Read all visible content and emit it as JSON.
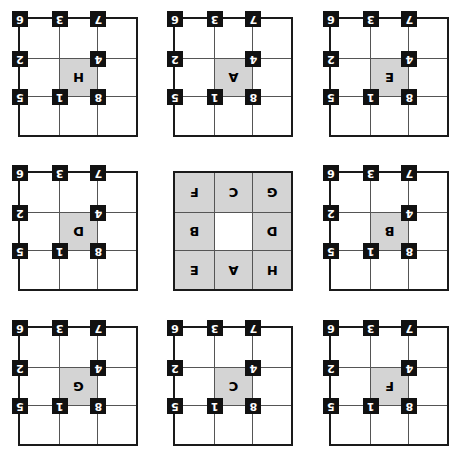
{
  "board": {
    "title": "Sliding tile puzzle state diagram",
    "rows": 3,
    "cols": 3,
    "rotation_degrees": 180,
    "colors": {
      "grid_border": "#1a1a1a",
      "cell_line": "#555555",
      "cell_background": "#ffffff",
      "highlight_background": "#d4d4d4",
      "badge_background": "#111111",
      "badge_text": "#ffffff",
      "letter_text": "#000000"
    },
    "corner_numbers": [
      "8",
      "1",
      "5",
      "4",
      "",
      "2",
      "7",
      "3",
      "6"
    ],
    "panels": [
      {
        "name": "panel-top-left",
        "is_center_panel": false,
        "show_numbers": true,
        "cells": [
          {
            "letter": "",
            "gray": false,
            "number": "8"
          },
          {
            "letter": "",
            "gray": false,
            "number": "1"
          },
          {
            "letter": "",
            "gray": false,
            "number": "5"
          },
          {
            "letter": "",
            "gray": false,
            "number": "4"
          },
          {
            "letter": "H",
            "gray": true,
            "number": ""
          },
          {
            "letter": "",
            "gray": false,
            "number": "2"
          },
          {
            "letter": "",
            "gray": false,
            "number": "7"
          },
          {
            "letter": "",
            "gray": false,
            "number": "3"
          },
          {
            "letter": "",
            "gray": false,
            "number": "6"
          }
        ]
      },
      {
        "name": "panel-top-center",
        "is_center_panel": false,
        "show_numbers": true,
        "cells": [
          {
            "letter": "",
            "gray": false,
            "number": "8"
          },
          {
            "letter": "",
            "gray": false,
            "number": "1"
          },
          {
            "letter": "",
            "gray": false,
            "number": "5"
          },
          {
            "letter": "",
            "gray": false,
            "number": "4"
          },
          {
            "letter": "A",
            "gray": true,
            "number": ""
          },
          {
            "letter": "",
            "gray": false,
            "number": "2"
          },
          {
            "letter": "",
            "gray": false,
            "number": "7"
          },
          {
            "letter": "",
            "gray": false,
            "number": "3"
          },
          {
            "letter": "",
            "gray": false,
            "number": "6"
          }
        ]
      },
      {
        "name": "panel-top-right",
        "is_center_panel": false,
        "show_numbers": true,
        "cells": [
          {
            "letter": "",
            "gray": false,
            "number": "8"
          },
          {
            "letter": "",
            "gray": false,
            "number": "1"
          },
          {
            "letter": "",
            "gray": false,
            "number": "5"
          },
          {
            "letter": "",
            "gray": false,
            "number": "4"
          },
          {
            "letter": "E",
            "gray": true,
            "number": ""
          },
          {
            "letter": "",
            "gray": false,
            "number": "2"
          },
          {
            "letter": "",
            "gray": false,
            "number": "7"
          },
          {
            "letter": "",
            "gray": false,
            "number": "3"
          },
          {
            "letter": "",
            "gray": false,
            "number": "6"
          }
        ]
      },
      {
        "name": "panel-middle-left",
        "is_center_panel": false,
        "show_numbers": true,
        "cells": [
          {
            "letter": "",
            "gray": false,
            "number": "8"
          },
          {
            "letter": "",
            "gray": false,
            "number": "1"
          },
          {
            "letter": "",
            "gray": false,
            "number": "5"
          },
          {
            "letter": "",
            "gray": false,
            "number": "4"
          },
          {
            "letter": "D",
            "gray": true,
            "number": ""
          },
          {
            "letter": "",
            "gray": false,
            "number": "2"
          },
          {
            "letter": "",
            "gray": false,
            "number": "7"
          },
          {
            "letter": "",
            "gray": false,
            "number": "3"
          },
          {
            "letter": "",
            "gray": false,
            "number": "6"
          }
        ]
      },
      {
        "name": "panel-center",
        "is_center_panel": true,
        "show_numbers": false,
        "cells": [
          {
            "letter": "H",
            "gray": true,
            "number": ""
          },
          {
            "letter": "A",
            "gray": true,
            "number": ""
          },
          {
            "letter": "E",
            "gray": true,
            "number": ""
          },
          {
            "letter": "D",
            "gray": true,
            "number": ""
          },
          {
            "letter": "",
            "gray": false,
            "number": ""
          },
          {
            "letter": "B",
            "gray": true,
            "number": ""
          },
          {
            "letter": "G",
            "gray": true,
            "number": ""
          },
          {
            "letter": "C",
            "gray": true,
            "number": ""
          },
          {
            "letter": "F",
            "gray": true,
            "number": ""
          }
        ]
      },
      {
        "name": "panel-middle-right",
        "is_center_panel": false,
        "show_numbers": true,
        "cells": [
          {
            "letter": "",
            "gray": false,
            "number": "8"
          },
          {
            "letter": "",
            "gray": false,
            "number": "1"
          },
          {
            "letter": "",
            "gray": false,
            "number": "5"
          },
          {
            "letter": "",
            "gray": false,
            "number": "4"
          },
          {
            "letter": "B",
            "gray": true,
            "number": ""
          },
          {
            "letter": "",
            "gray": false,
            "number": "2"
          },
          {
            "letter": "",
            "gray": false,
            "number": "7"
          },
          {
            "letter": "",
            "gray": false,
            "number": "3"
          },
          {
            "letter": "",
            "gray": false,
            "number": "6"
          }
        ]
      },
      {
        "name": "panel-bottom-left",
        "is_center_panel": false,
        "show_numbers": true,
        "cells": [
          {
            "letter": "",
            "gray": false,
            "number": "8"
          },
          {
            "letter": "",
            "gray": false,
            "number": "1"
          },
          {
            "letter": "",
            "gray": false,
            "number": "5"
          },
          {
            "letter": "",
            "gray": false,
            "number": "4"
          },
          {
            "letter": "G",
            "gray": true,
            "number": ""
          },
          {
            "letter": "",
            "gray": false,
            "number": "2"
          },
          {
            "letter": "",
            "gray": false,
            "number": "7"
          },
          {
            "letter": "",
            "gray": false,
            "number": "3"
          },
          {
            "letter": "",
            "gray": false,
            "number": "6"
          }
        ]
      },
      {
        "name": "panel-bottom-center",
        "is_center_panel": false,
        "show_numbers": true,
        "cells": [
          {
            "letter": "",
            "gray": false,
            "number": "8"
          },
          {
            "letter": "",
            "gray": false,
            "number": "1"
          },
          {
            "letter": "",
            "gray": false,
            "number": "5"
          },
          {
            "letter": "",
            "gray": false,
            "number": "4"
          },
          {
            "letter": "C",
            "gray": true,
            "number": ""
          },
          {
            "letter": "",
            "gray": false,
            "number": "2"
          },
          {
            "letter": "",
            "gray": false,
            "number": "7"
          },
          {
            "letter": "",
            "gray": false,
            "number": "3"
          },
          {
            "letter": "",
            "gray": false,
            "number": "6"
          }
        ]
      },
      {
        "name": "panel-bottom-right",
        "is_center_panel": false,
        "show_numbers": true,
        "cells": [
          {
            "letter": "",
            "gray": false,
            "number": "8"
          },
          {
            "letter": "",
            "gray": false,
            "number": "1"
          },
          {
            "letter": "",
            "gray": false,
            "number": "5"
          },
          {
            "letter": "",
            "gray": false,
            "number": "4"
          },
          {
            "letter": "F",
            "gray": true,
            "number": ""
          },
          {
            "letter": "",
            "gray": false,
            "number": "2"
          },
          {
            "letter": "",
            "gray": false,
            "number": "7"
          },
          {
            "letter": "",
            "gray": false,
            "number": "3"
          },
          {
            "letter": "",
            "gray": false,
            "number": "6"
          }
        ]
      }
    ]
  }
}
